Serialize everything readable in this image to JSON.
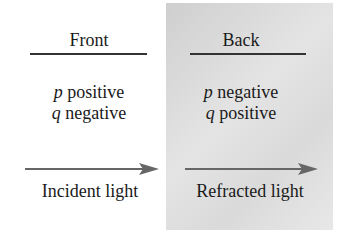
{
  "front": {
    "title": "Front",
    "p_var": "p",
    "p_sign": " positive",
    "q_var": "q",
    "q_sign": " negative",
    "arrow_label": "Incident light"
  },
  "back": {
    "title": "Back",
    "p_var": "p",
    "p_sign": " negative",
    "q_var": "q",
    "q_sign": " positive",
    "arrow_label": "Refracted light"
  },
  "colors": {
    "panel_back": "#d9d9d9",
    "arrow": "#666666",
    "text": "#1a1a1a"
  }
}
